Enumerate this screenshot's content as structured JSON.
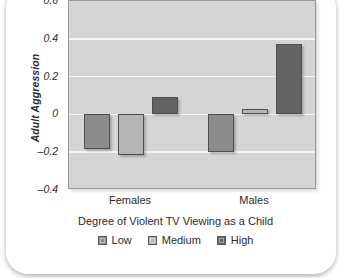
{
  "card": {
    "background": "#ffffff"
  },
  "chart_data": {
    "type": "bar",
    "title": "The Relationship Between Violent TV Viewing and Adult Aggression",
    "subtitle": "",
    "xlabel": "Degree of Violent TV Viewing as a Child",
    "ylabel": "Adult Aggression",
    "categories": [
      "Females",
      "Males"
    ],
    "series": [
      {
        "name": "Low",
        "values": [
          -0.185,
          -0.2
        ],
        "color": "#8c8c8c"
      },
      {
        "name": "Medium",
        "values": [
          -0.215,
          0.03
        ],
        "color": "#b5b5b5"
      },
      {
        "name": "High",
        "values": [
          0.09,
          0.37
        ],
        "color": "#636363"
      }
    ],
    "ylim": [
      -0.4,
      0.6
    ],
    "yticks": [
      0.6,
      0.4,
      0.2,
      0,
      -0.2,
      -0.4
    ],
    "ytick_labels": [
      "0.6",
      "0.4",
      "0.2",
      "0",
      "–0.2",
      "–0.4"
    ],
    "grid": true,
    "grid_color": "#f4f4f4",
    "plot_background": "#d5d5d5",
    "legend_position": "bottom",
    "zero_line": 0
  }
}
